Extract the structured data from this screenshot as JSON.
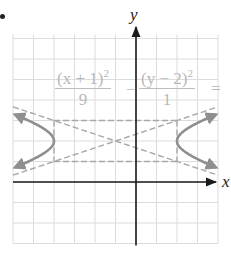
{
  "figure": {
    "bullet": "•",
    "axis_labels": {
      "x": "x",
      "y": "y"
    },
    "equation": {
      "term1_numerator": "(x + 1)",
      "term1_exponent": "2",
      "term1_denominator": "9",
      "operator": "−",
      "term2_numerator": "(y − 2)",
      "term2_exponent": "2",
      "term2_denominator": "1",
      "equals": "="
    },
    "colors": {
      "grid": "#dcdcdc",
      "axis": "#1a1a1a",
      "curve": "#8f8f8f",
      "dashed": "#a8a8a8",
      "equation_text": "#b8b8b8"
    }
  },
  "chart_data": {
    "type": "line",
    "title": "",
    "xlabel": "x",
    "ylabel": "y",
    "equation": "(x + 1)^2 / 9 - (y - 2)^2 / 1 = 1",
    "center": [
      -1,
      2
    ],
    "a": 3,
    "b": 1,
    "vertices": [
      [
        -4,
        2
      ],
      [
        2,
        2
      ]
    ],
    "asymptotes": [
      "y - 2 = (1/3)(x + 1)",
      "y - 2 = -(1/3)(x + 1)"
    ],
    "fundamental_rectangle": {
      "x": [
        -4,
        2
      ],
      "y": [
        1,
        3
      ]
    },
    "xlim": [
      -6,
      4
    ],
    "ylim": [
      -3,
      7
    ],
    "grid": true,
    "grid_step": 1
  }
}
